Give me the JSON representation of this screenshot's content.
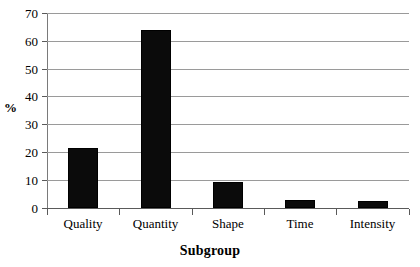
{
  "chart_data": {
    "type": "bar",
    "title": "",
    "subtitle": "",
    "xlabel": "Subgroup",
    "ylabel": "%",
    "categories": [
      "Quality",
      "Quantity",
      "Shape",
      "Time",
      "Intensity"
    ],
    "values": [
      21.5,
      64,
      9.5,
      3,
      2.5
    ],
    "series": [
      {
        "name": "",
        "values": [
          21.5,
          64,
          9.5,
          3,
          2.5
        ]
      }
    ],
    "ylim": [
      0,
      70
    ],
    "ytick_step": 10,
    "yticks": [
      0,
      10,
      20,
      30,
      40,
      50,
      60,
      70
    ],
    "ytick_labels": [
      "0",
      "10",
      "20",
      "30",
      "40",
      "50",
      "60",
      "70"
    ],
    "grid": true,
    "grid_axis": "y",
    "legend": false,
    "legend_position": "none",
    "bar_color": "#0b0b0b",
    "grid_color": "#9a9a9a",
    "axis_color": "#5a5a5a",
    "background": "#ffffff"
  }
}
